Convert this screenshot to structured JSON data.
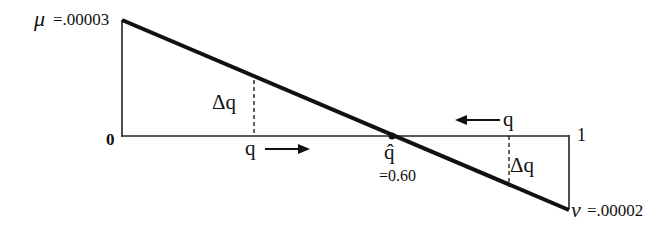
{
  "diagram": {
    "top_left_label": {
      "symbol": "μ",
      "value": "=.00003"
    },
    "bottom_right_label": {
      "symbol": "ν",
      "value": "=.00002"
    },
    "origin_label": "0",
    "one_label": "1",
    "equilibrium": {
      "symbol": "q̂",
      "value": "=0.60"
    },
    "left_q_label": "q",
    "right_q_label": "q",
    "left_delta_label": "Δq",
    "right_delta_label": "Δq",
    "arrows": [
      {
        "position": "left",
        "direction": "right"
      },
      {
        "position": "right",
        "direction": "left"
      }
    ]
  }
}
